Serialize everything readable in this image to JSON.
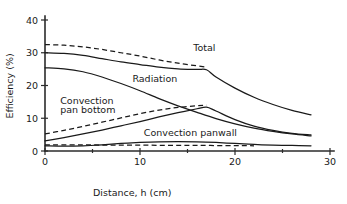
{
  "chart_data": {
    "type": "line",
    "title": "",
    "xlabel": "Distance, h (cm)",
    "ylabel": "Efficiency (%)",
    "xlim": [
      0,
      30
    ],
    "ylim": [
      0,
      40
    ],
    "xticks": [
      "0",
      "10",
      "20",
      "30"
    ],
    "yticks": [
      "0",
      "10",
      "20",
      "30",
      "40"
    ],
    "xtick_values": [
      0,
      10,
      20,
      30
    ],
    "ytick_values": [
      0,
      10,
      20,
      30,
      40
    ],
    "grid": false,
    "legend": "inline-curve-labels",
    "annotations": [
      {
        "text": "Total",
        "x": 15.6,
        "y": 30.4
      },
      {
        "text": "Radiation",
        "x": 9.2,
        "y": 21.2
      },
      {
        "text": "Convection",
        "x": 1.6,
        "y": 14.2
      },
      {
        "text": "pan bottom",
        "x": 1.6,
        "y": 11.5
      },
      {
        "text": "Convection panwall",
        "x": 10.4,
        "y": 4.6
      }
    ],
    "series": [
      {
        "name": "Total (dashed)",
        "style": "dashed",
        "x": [
          0,
          2,
          4,
          6,
          8,
          10,
          12,
          14,
          16,
          17
        ],
        "y": [
          32.5,
          32.3,
          31.8,
          31.0,
          30.0,
          29.0,
          27.8,
          26.8,
          26.0,
          25.6
        ]
      },
      {
        "name": "Total (solid)",
        "style": "solid",
        "x": [
          0,
          2,
          4,
          6,
          8,
          10,
          12,
          14,
          16,
          17,
          18,
          20,
          22,
          24,
          26,
          28
        ],
        "y": [
          30.0,
          29.8,
          29.2,
          28.2,
          27.2,
          26.4,
          25.6,
          25.1,
          24.9,
          24.8,
          22.6,
          19.2,
          16.4,
          14.2,
          12.4,
          11.0
        ]
      },
      {
        "name": "Radiation (solid)",
        "style": "solid",
        "x": [
          0,
          2,
          4,
          6,
          8,
          10,
          12,
          14,
          16,
          18,
          20,
          22,
          24,
          26,
          28
        ],
        "y": [
          25.4,
          25.1,
          24.2,
          22.6,
          20.6,
          18.4,
          16.0,
          13.8,
          11.8,
          9.9,
          8.3,
          7.0,
          6.0,
          5.2,
          4.6
        ]
      },
      {
        "name": "Convection pan bottom (dashed)",
        "style": "dashed",
        "x": [
          0,
          2,
          4,
          6,
          8,
          10,
          12,
          14,
          16,
          17
        ],
        "y": [
          5.2,
          6.3,
          7.5,
          8.8,
          10.1,
          11.4,
          12.5,
          13.3,
          13.8,
          14.0
        ]
      },
      {
        "name": "Convection pan bottom (solid)",
        "style": "solid",
        "x": [
          0,
          2,
          4,
          6,
          8,
          10,
          12,
          14,
          16,
          17,
          18,
          20,
          22,
          24,
          26,
          28
        ],
        "y": [
          3.1,
          4.1,
          5.2,
          6.4,
          7.7,
          9.0,
          10.4,
          11.7,
          12.9,
          13.4,
          12.2,
          9.6,
          7.6,
          6.3,
          5.4,
          4.9
        ]
      },
      {
        "name": "Convection panwall (solid)",
        "style": "solid",
        "x": [
          0,
          2,
          4,
          6,
          8,
          10,
          12,
          14,
          16,
          18,
          20,
          22,
          24,
          26,
          28
        ],
        "y": [
          1.6,
          1.5,
          1.6,
          1.9,
          2.3,
          2.6,
          2.8,
          2.85,
          2.8,
          2.6,
          2.3,
          2.0,
          1.8,
          1.7,
          1.6
        ]
      },
      {
        "name": "Convection panwall (dashed)",
        "style": "dashed",
        "x": [
          0,
          4,
          8,
          12,
          16,
          20,
          22
        ],
        "y": [
          1.9,
          1.85,
          1.8,
          1.75,
          1.7,
          1.65,
          1.6
        ]
      }
    ]
  }
}
